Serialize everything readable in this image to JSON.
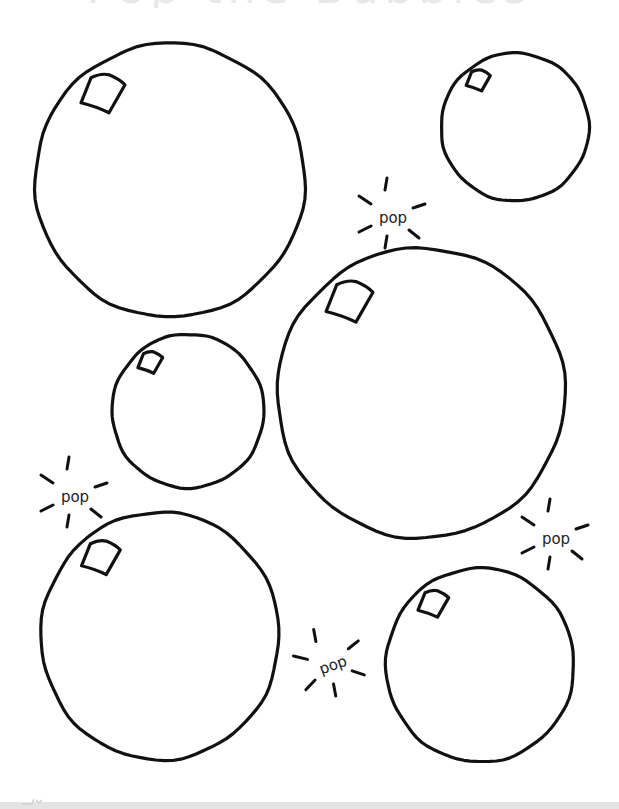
{
  "page": {
    "title": "Pop the Bubbles",
    "background": "#ffffff",
    "stroke_color": "#111111"
  },
  "bubbles": [
    {
      "id": "bubble-large-top-left",
      "cx": 170,
      "cy": 180,
      "rx": 135,
      "ry": 137
    },
    {
      "id": "bubble-small-top-right",
      "cx": 515,
      "cy": 127,
      "rx": 74,
      "ry": 74
    },
    {
      "id": "bubble-large-center-right",
      "cx": 421,
      "cy": 393,
      "rx": 144,
      "ry": 145
    },
    {
      "id": "bubble-small-center-left",
      "cx": 188,
      "cy": 411,
      "rx": 76,
      "ry": 77
    },
    {
      "id": "bubble-large-bottom-left",
      "cx": 160,
      "cy": 636,
      "rx": 119,
      "ry": 124
    },
    {
      "id": "bubble-medium-bottom-right",
      "cx": 480,
      "cy": 665,
      "rx": 94,
      "ry": 97
    }
  ],
  "pops": [
    {
      "id": "pop-top-center",
      "text": "pop",
      "x": 393,
      "y": 218,
      "rotate": 0
    },
    {
      "id": "pop-left",
      "text": "pop",
      "x": 75,
      "y": 497,
      "rotate": 0
    },
    {
      "id": "pop-right",
      "text": "pop",
      "x": 556,
      "y": 539,
      "rotate": 0
    },
    {
      "id": "pop-bottom-center",
      "text": "pop",
      "x": 333,
      "y": 665,
      "rotate": -20
    }
  ],
  "bottom_bar": {
    "color": "#e4e4e4"
  }
}
